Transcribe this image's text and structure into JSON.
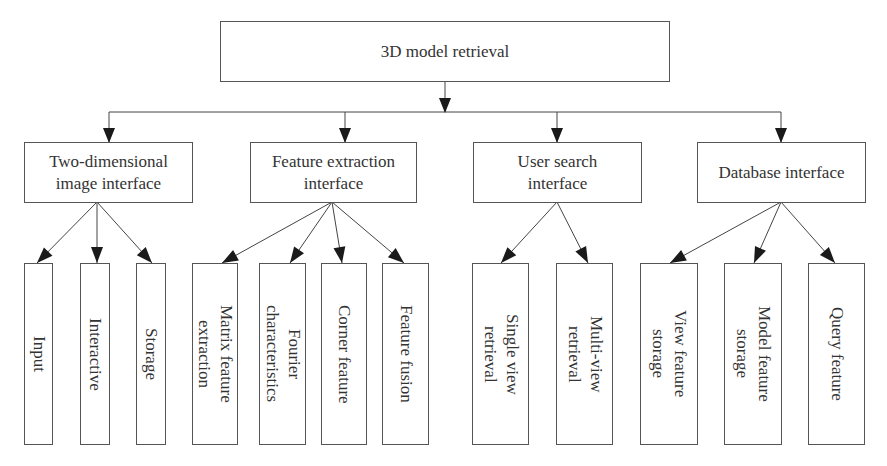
{
  "diagram": {
    "root": {
      "label": "3D model retrieval"
    },
    "branches": [
      {
        "label_lines": [
          "Two-dimensional",
          "image interface"
        ],
        "children": [
          {
            "lines": [
              "Input"
            ]
          },
          {
            "lines": [
              "Interactive"
            ]
          },
          {
            "lines": [
              "Storage"
            ]
          }
        ]
      },
      {
        "label_lines": [
          "Feature extraction",
          "interface"
        ],
        "children": [
          {
            "lines": [
              "Matrix feature",
              "extraction"
            ]
          },
          {
            "lines": [
              "Fourier",
              "characteristics"
            ]
          },
          {
            "lines": [
              "Corner feature"
            ]
          },
          {
            "lines": [
              "Feature fusion"
            ]
          }
        ]
      },
      {
        "label_lines": [
          "User search",
          "interface"
        ],
        "children": [
          {
            "lines": [
              "Single view",
              "retrieval"
            ]
          },
          {
            "lines": [
              "Multi-view",
              "retrieval"
            ]
          }
        ]
      },
      {
        "label_lines": [
          "Database interface"
        ],
        "children": [
          {
            "lines": [
              "View feature",
              "storage"
            ]
          },
          {
            "lines": [
              "Model feature",
              "storage"
            ]
          },
          {
            "lines": [
              "Query feature"
            ]
          }
        ]
      }
    ],
    "colors": {
      "line": "#444444",
      "border": "#555555",
      "text": "#333333",
      "background": "#ffffff"
    }
  }
}
